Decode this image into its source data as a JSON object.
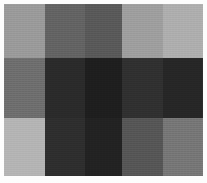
{
  "figure": {
    "background_color": "#fdfdfd",
    "border_color": "#ffffff"
  },
  "chart_data": {
    "type": "heatmap",
    "xlabel": "",
    "ylabel": "",
    "columns": 5,
    "rows": 3,
    "column_labels": [
      "C1",
      "C2",
      "C3",
      "C4",
      "C5"
    ],
    "row_labels": [
      "R1",
      "R2",
      "R3"
    ],
    "column_widths_px": [
      41,
      40,
      37,
      41,
      40
    ],
    "row_heights_px": [
      54,
      60,
      58
    ],
    "colormap": "grayscale",
    "grid": false,
    "legend": "none",
    "values": [
      [
        154,
        99,
        89,
        158,
        174
      ],
      [
        110,
        42,
        30,
        48,
        38
      ],
      [
        180,
        46,
        34,
        86,
        118
      ]
    ],
    "colors": [
      [
        "#9a9a9a",
        "#636363",
        "#595959",
        "#9e9e9e",
        "#aeaeae"
      ],
      [
        "#6e6e6e",
        "#2a2a2a",
        "#1e1e1e",
        "#303030",
        "#262626"
      ],
      [
        "#b4b4b4",
        "#2e2e2e",
        "#222222",
        "#565656",
        "#767676"
      ]
    ],
    "cell_names": [
      [
        "cell-r1c1",
        "cell-r1c2",
        "cell-r1c3",
        "cell-r1c4",
        "cell-r1c5"
      ],
      [
        "cell-r2c1",
        "cell-r2c2",
        "cell-r2c3",
        "cell-r2c4",
        "cell-r2c5"
      ],
      [
        "cell-r3c1",
        "cell-r3c2",
        "cell-r3c3",
        "cell-r3c4",
        "cell-r3c5"
      ]
    ]
  }
}
